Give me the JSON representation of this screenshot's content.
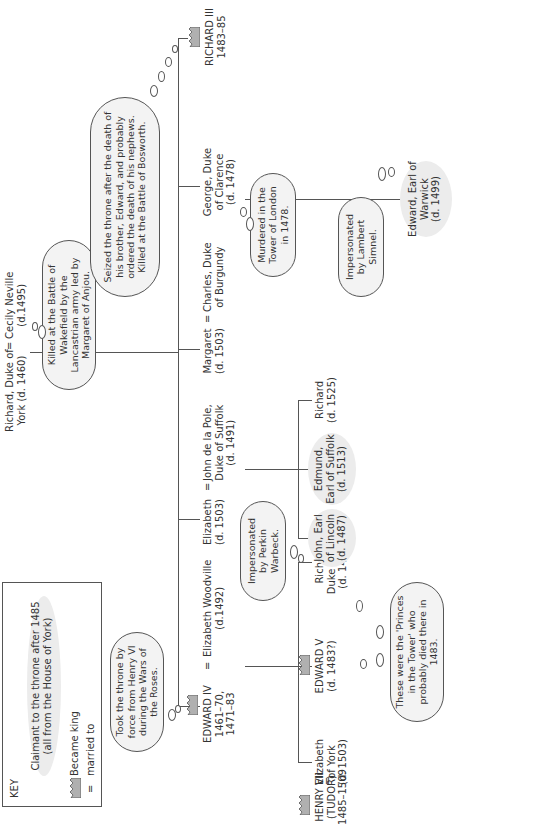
{
  "key": {
    "title": "KEY",
    "claimant_line1": "Claimant to the throne after 1485",
    "claimant_line2": "(all from the House of York)",
    "became_king": "Became king",
    "married_symbol": "=",
    "married_to": "married to"
  },
  "generation1": {
    "richard_york_l1": "Richard, Duke of",
    "richard_york_l2": "York (d. 1460)",
    "eq": "=",
    "cecily_l1": "Cecily Neville",
    "cecily_l2": "(d.1495)"
  },
  "generation2": {
    "edward_iv_l1": "EDWARD IV",
    "edward_iv_l2": "1461–70,",
    "edward_iv_l3": "1471–83",
    "eq": "=",
    "woodville_l1": "Elizabeth Woodville",
    "woodville_l2": "(d.1492)",
    "elizabeth_l1": "Elizabeth",
    "elizabeth_l2": "(d. 1503)",
    "delapole_l1": "John de la Pole,",
    "delapole_l2": "Duke of Suffolk",
    "delapole_l3": "(d. 1491)",
    "margaret_l1": "Margaret",
    "margaret_l2": "(d. 1503)",
    "charles_l1": "Charles, Duke",
    "charles_l2": "of Burgundy",
    "george_l1": "George, Duke",
    "george_l2": "of Clarence",
    "george_l3": "(d. 1478)",
    "richard3_l1": "RICHARD III",
    "richard3_l2": "1483–85"
  },
  "generation3": {
    "henry7_l1": "HENRY VII",
    "henry7_l2": "(TUDOR)",
    "henry7_l3": "1485–1509",
    "eq": "=",
    "eliz_york_l1": "Elizabeth",
    "eliz_york_l2": "of York",
    "eliz_york_l3": "(d. 1503)",
    "edward5_l1": "EDWARD V",
    "edward5_l2": "(d. 1483?)",
    "richard_york2_l1": "Richard,",
    "richard_york2_l2": "Duke of York",
    "richard_york2_l3": "(d. 1483?)",
    "john_l1": "John, Earl",
    "john_l2": "of Lincoln",
    "john_l3": "(d. 1487)",
    "edmund_l1": "Edmund,",
    "edmund_l2": "Earl of Suffolk",
    "edmund_l3": "(d. 1513)",
    "richard_dp_l1": "Richard",
    "richard_dp_l2": "(d. 1525)",
    "warwick_l1": "Edward, Earl of",
    "warwick_l2": "Warwick",
    "warwick_l3": "(d. 1499)"
  },
  "clouds": {
    "wakefield": "Killed at the Battle of Wakefield by the Lancastrian army led by Margaret of Anjou.",
    "edward4": "Took the throne by force from Henry VI during the Wars of the Roses.",
    "richard3": "Seized the throne after the death of his brother, Edward, and probably ordered the death of his nephews. Killed at the Battle of Bosworth.",
    "george": "Murdered in the Tower of London in 1478.",
    "simnel": "Impersonated by Lambert Simnel.",
    "warbeck": "Impersonated by Perkin Warbeck.",
    "princes": "These were the 'Princes in the Tower' who probably died there in 1483."
  },
  "colors": {
    "line": "#555555",
    "claimant_fill": "#ececec",
    "cloud_fill": "#f3f3f3",
    "crown_fill": "#b0b0b0"
  }
}
